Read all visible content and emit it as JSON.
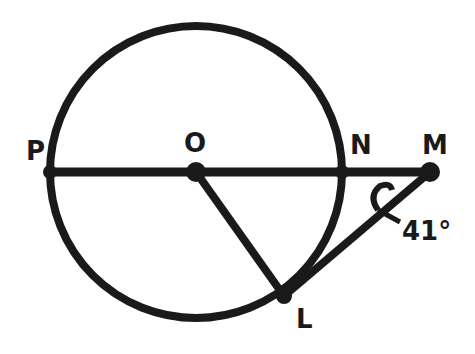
{
  "diagram": {
    "points": {
      "P": "P",
      "O": "O",
      "N": "N",
      "M": "M",
      "L": "L"
    },
    "angle_label": "41°",
    "stroke_color": "#1a1a1a",
    "background": "#ffffff"
  }
}
